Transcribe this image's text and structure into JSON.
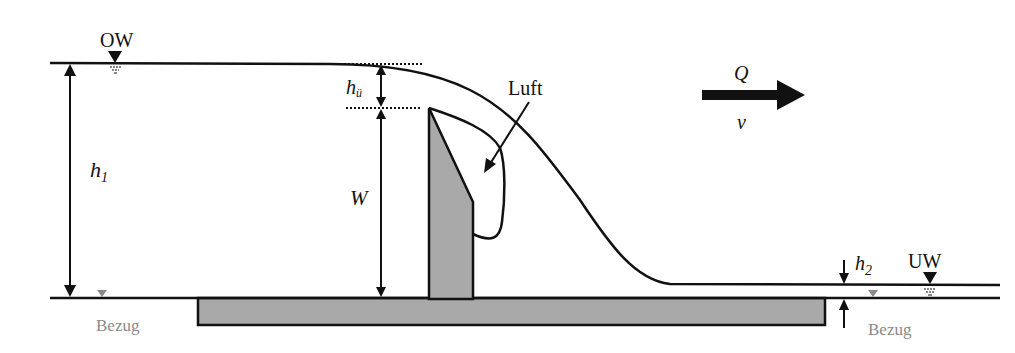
{
  "labels": {
    "headwater": "OW",
    "tailwater": "UW",
    "overflow_height_h": "h",
    "overflow_height_sub": "ü",
    "upstream_depth_h": "h",
    "upstream_depth_sub": "1",
    "weir_height": "W",
    "downstream_depth_h": "h",
    "downstream_depth_sub": "2",
    "air": "Luft",
    "discharge": "Q",
    "velocity": "v",
    "datum_left": "Bezug",
    "datum_right": "Bezug"
  },
  "colors": {
    "line": "#111111",
    "concrete": "#a9a9a9",
    "datum": "#8a8a8a"
  }
}
